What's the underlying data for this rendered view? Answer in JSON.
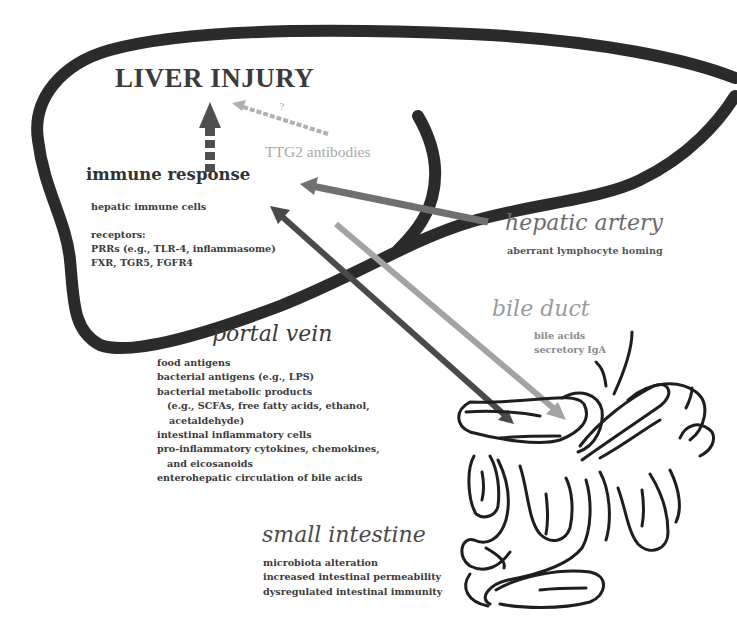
{
  "liver": {
    "title": "LIVER INJURY",
    "unknown_marker": "?",
    "ttg2_label": "TTG2 antibodies",
    "immune_response": {
      "title": "immune response",
      "cells": "hepatic immune cells",
      "receptors_label": "receptors:",
      "receptors": [
        "PRRs (e.g., TLR-4, inflammasome)",
        "FXR, TGR5, FGFR4"
      ]
    }
  },
  "hepatic_artery": {
    "title": "hepatic artery",
    "items": [
      "aberrant lymphocyte homing"
    ]
  },
  "bile_duct": {
    "title": "bile duct",
    "items": [
      "bile acids",
      "secretory IgA"
    ]
  },
  "portal_vein": {
    "title": "portal vein",
    "items": [
      "food antigens",
      "bacterial antigens (e.g., LPS)",
      "bacterial metabolic products",
      "(e.g., SCFAs, free fatty acids, ethanol,",
      "acetaldehyde)",
      "intestinal inflammatory cells",
      "pro-inflammatory cytokines, chemokines,",
      "and eicosanoids",
      "enterohepatic circulation of bile acids"
    ]
  },
  "small_intestine": {
    "title": "small intestine",
    "items": [
      "microbiota alteration",
      "increased intestinal permeability",
      "dysregulated intestinal immunity"
    ]
  },
  "colors": {
    "outline": "#2b2b2b",
    "hepatic_artery_arrow": "#707070",
    "portal_vein_arrow": "#4a4a4a",
    "bile_duct_arrow": "#a3a3a3",
    "immune_arrow": "#4f4f4f",
    "ttg2_arrow": "#b0b0b0",
    "hepatic_artery_text": "#6b6b6b",
    "bile_duct_text": "#9a9a9a",
    "portal_vein_text": "#3a3a3a",
    "small_intestine_text": "#4a4a4a"
  }
}
